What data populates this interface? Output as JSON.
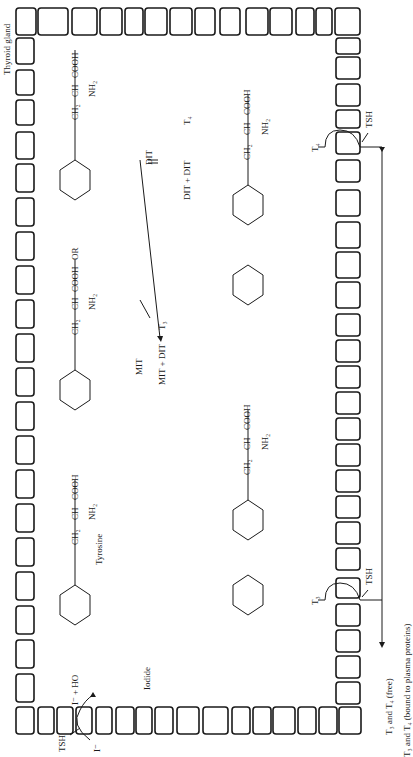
{
  "figure": {
    "orientation": "rotated 90deg clockwise",
    "gland_label": "Thyroid gland",
    "iodide_label": "Iodide",
    "tyrosine_label": "Tyrosine",
    "tsh": "TSH",
    "iodide_ion": "I⁻",
    "iodide_plus": "I⁻ + HO",
    "or_label": "OR",
    "structures": {
      "tyrosine": {
        "chain": [
          "CH₂",
          "CH",
          "COOH"
        ],
        "amine": "NH₂"
      },
      "mit": {
        "chain": [
          "CH₂",
          "CH",
          "COOH"
        ],
        "amine": "NH₂",
        "substituents": [
          "HO",
          "I"
        ]
      },
      "dit": {
        "chain": [
          "CH₂",
          "CH",
          "COOH"
        ],
        "amine": "NH₂",
        "substituents": [
          "HO",
          "I",
          "I"
        ]
      },
      "t3": {
        "chain": [
          "CH₂",
          "CH",
          "COOH"
        ],
        "amine": "NH₂",
        "substituents": [
          "HO",
          "I",
          "O",
          "I",
          "I"
        ]
      },
      "t4": {
        "chain": [
          "CH₂",
          "CH",
          "COOH"
        ],
        "amine": "NH₂",
        "substituents": [
          "HO",
          "I",
          "I",
          "O",
          "I",
          "I"
        ]
      }
    },
    "reactions": {
      "mit": "MIT",
      "dit": "DIT",
      "mit_dit": "MIT + DIT",
      "t3": "T₃",
      "dit_dit": "DIT + DIT",
      "t4": "T₄"
    },
    "release": {
      "t3": "T₃",
      "t4": "T₄",
      "free": "T₃ and T₄ (free)",
      "bound": "T₃ and T₄ (bound to plasma proteins)"
    }
  }
}
